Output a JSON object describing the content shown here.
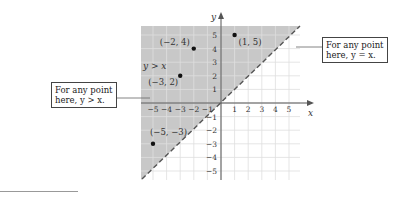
{
  "axes": {
    "x_label": "x",
    "y_label": "y",
    "x_ticks": [
      "-5",
      "-4",
      "-3",
      "-2",
      "-1",
      "1",
      "2",
      "3",
      "4",
      "5"
    ],
    "y_ticks": [
      "5",
      "4",
      "3",
      "2",
      "1",
      "-1",
      "-2",
      "-3",
      "-4",
      "-5"
    ],
    "range": [
      -5.5,
      5.5
    ]
  },
  "region_label": "y > x",
  "boundary_line": "y = x (dashed)",
  "points": [
    {
      "label": "(−2, 4)",
      "x": -2,
      "y": 4
    },
    {
      "label": "(1, 5)",
      "x": 1,
      "y": 5
    },
    {
      "label": "(−3, 2)",
      "x": -3,
      "y": 2
    },
    {
      "label": "(−5, −3)",
      "x": -5,
      "y": -3
    }
  ],
  "callouts": {
    "left": {
      "line1": "For any point",
      "line2": "here, y > x."
    },
    "right": {
      "line1": "For any point",
      "line2": "here, y = x."
    }
  },
  "colors": {
    "shade": "#c8c8c8",
    "grid": "#dcdcdc",
    "axis": "#555555",
    "dashed": "#555555",
    "point": "#111111"
  }
}
